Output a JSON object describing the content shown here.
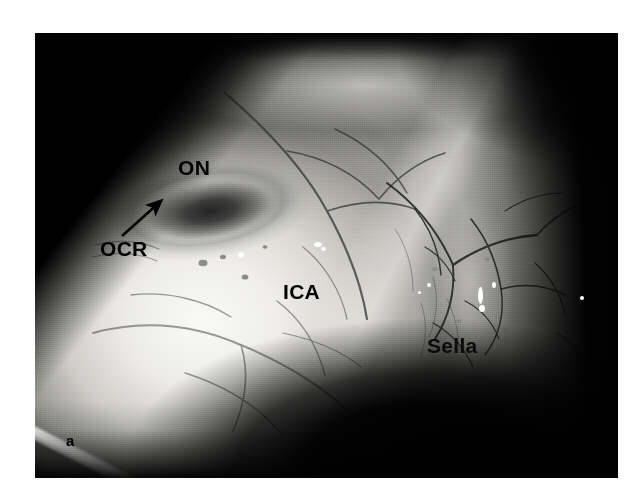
{
  "figure": {
    "panel_letter": "a",
    "modality": "endoscopic-photograph",
    "color_mode": "grayscale",
    "frame": {
      "x": 35,
      "y": 33,
      "width": 583,
      "height": 445,
      "background_color": "#050505",
      "page_background": "#ffffff"
    },
    "annotations": [
      {
        "id": "on",
        "label": "ON",
        "meaning": "optic nerve",
        "x": 178,
        "y": 157,
        "font_size": 21,
        "color": "#000000",
        "has_leader_arrow": false
      },
      {
        "id": "ocr",
        "label": "OCR",
        "meaning": "opticocarotid recess",
        "x": 100,
        "y": 238,
        "font_size": 21,
        "color": "#000000",
        "has_leader_arrow": true,
        "arrow": {
          "tail_x": 122,
          "tail_y": 236,
          "head_x": 161,
          "head_y": 201,
          "color": "#000000",
          "stroke_width": 2.6
        }
      },
      {
        "id": "ica",
        "label": "ICA",
        "meaning": "internal carotid artery",
        "x": 283,
        "y": 281,
        "font_size": 21,
        "color": "#000000",
        "has_leader_arrow": false
      },
      {
        "id": "sella",
        "label": "Sella",
        "meaning": "sella turcica",
        "x": 427,
        "y": 335,
        "font_size": 21,
        "color": "#0a0a0a",
        "has_leader_arrow": false
      }
    ],
    "specular_highlights": [
      {
        "x": 203,
        "y": 219,
        "w": 6,
        "h": 6
      },
      {
        "x": 279,
        "y": 209,
        "w": 8,
        "h": 5
      },
      {
        "x": 286,
        "y": 214,
        "w": 5,
        "h": 4
      },
      {
        "x": 443,
        "y": 254,
        "w": 5,
        "h": 17
      },
      {
        "x": 444,
        "y": 272,
        "w": 6,
        "h": 7
      },
      {
        "x": 457,
        "y": 249,
        "w": 4,
        "h": 6
      },
      {
        "x": 392,
        "y": 250,
        "w": 4,
        "h": 4
      },
      {
        "x": 545,
        "y": 263,
        "w": 4,
        "h": 4
      },
      {
        "x": 383,
        "y": 258,
        "w": 3,
        "h": 3
      }
    ],
    "instrument": {
      "name": "retractor-blade",
      "description": "white instrument edge at lower-left of the field",
      "angle_deg": 27
    }
  }
}
